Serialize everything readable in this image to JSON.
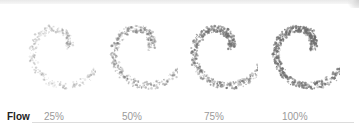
{
  "row_label": "Flow",
  "samples": [
    {
      "label": "25%",
      "flow": 25,
      "opacity": 0.35
    },
    {
      "label": "50%",
      "flow": 50,
      "opacity": 0.55
    },
    {
      "label": "75%",
      "flow": 75,
      "opacity": 0.72
    },
    {
      "label": "100%",
      "flow": 100,
      "opacity": 0.85
    }
  ],
  "colors": {
    "stroke": "#6e6e6e",
    "label": "#9a9a9a",
    "title": "#222222",
    "divider": "#dcdcdc"
  }
}
